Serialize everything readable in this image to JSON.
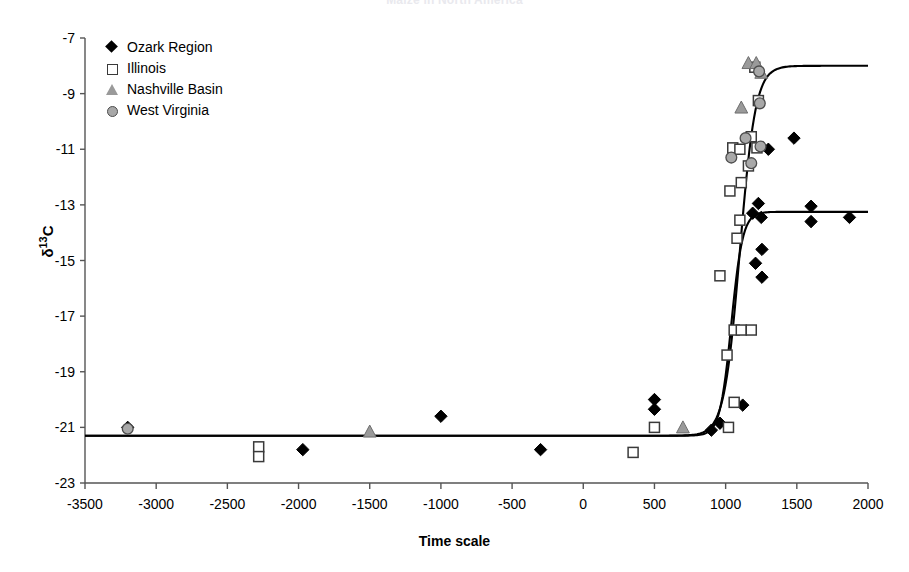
{
  "chart_data": {
    "type": "scatter",
    "title": "Maize in North America",
    "xlabel": "Time scale",
    "ylabel": "δ 13C",
    "xlim": [
      -3500,
      2000
    ],
    "ylim": [
      -23,
      -7
    ],
    "xticks": [
      -3500,
      -3000,
      -2500,
      -2000,
      -1500,
      -1000,
      -500,
      0,
      500,
      1000,
      1500,
      2000
    ],
    "yticks": [
      -23,
      -21,
      -19,
      -17,
      -15,
      -13,
      -11,
      -9,
      -7
    ],
    "xtick_labels": [
      "-3500",
      "-3000",
      "-2500",
      "-2000",
      "-1500",
      "-1000",
      "-500",
      "0",
      "500",
      "1000",
      "1500",
      "2000"
    ],
    "ytick_labels": [
      "-23",
      "-21",
      "-19",
      "-17",
      "-15",
      "-13",
      "-11",
      "-9",
      "-7"
    ],
    "grid": false,
    "legend_position": "top-left",
    "series": [
      {
        "name": "Ozark Region",
        "marker": "diamond",
        "color": "#000000",
        "fill": "#000000",
        "points": [
          [
            -3200,
            -21.0
          ],
          [
            -1970,
            -21.8
          ],
          [
            -1000,
            -20.6
          ],
          [
            -300,
            -21.8
          ],
          [
            500,
            -20.0
          ],
          [
            500,
            -20.35
          ],
          [
            900,
            -21.1
          ],
          [
            960,
            -20.85
          ],
          [
            1120,
            -20.2
          ],
          [
            1190,
            -13.3
          ],
          [
            1230,
            -12.95
          ],
          [
            1250,
            -13.45
          ],
          [
            1255,
            -14.6
          ],
          [
            1210,
            -15.1
          ],
          [
            1255,
            -15.6
          ],
          [
            1300,
            -11.0
          ],
          [
            1480,
            -10.6
          ],
          [
            1600,
            -13.05
          ],
          [
            1600,
            -13.6
          ],
          [
            1870,
            -13.45
          ]
        ]
      },
      {
        "name": "Illinois",
        "marker": "square",
        "color": "#3a3a3a",
        "fill": "#ffffff",
        "points": [
          [
            -2280,
            -21.7
          ],
          [
            -2280,
            -22.05
          ],
          [
            350,
            -21.9
          ],
          [
            500,
            -21.0
          ],
          [
            1020,
            -21.0
          ],
          [
            1060,
            -20.1
          ],
          [
            1010,
            -18.4
          ],
          [
            1060,
            -17.5
          ],
          [
            1110,
            -17.5
          ],
          [
            1180,
            -17.5
          ],
          [
            960,
            -15.55
          ],
          [
            1080,
            -14.2
          ],
          [
            1100,
            -13.55
          ],
          [
            1030,
            -12.5
          ],
          [
            1110,
            -12.2
          ],
          [
            1160,
            -11.6
          ],
          [
            1050,
            -10.95
          ],
          [
            1100,
            -11.0
          ],
          [
            1180,
            -10.55
          ],
          [
            1220,
            -10.95
          ],
          [
            1230,
            -9.25
          ],
          [
            1205,
            -8.05
          ]
        ]
      },
      {
        "name": "Nashville Basin",
        "marker": "triangle",
        "color": "#9a9a9a",
        "fill": "#9a9a9a",
        "points": [
          [
            -1500,
            -21.15
          ],
          [
            700,
            -21.0
          ],
          [
            1110,
            -9.5
          ],
          [
            1160,
            -7.9
          ],
          [
            1215,
            -7.9
          ],
          [
            1250,
            -8.25
          ]
        ]
      },
      {
        "name": "West Virginia",
        "marker": "circle",
        "color": "#4d4d4d",
        "fill": "#a8a8a8",
        "points": [
          [
            -3200,
            -21.05
          ],
          [
            1040,
            -11.3
          ],
          [
            1140,
            -10.6
          ],
          [
            1180,
            -11.5
          ],
          [
            1245,
            -10.9
          ],
          [
            1240,
            -9.35
          ],
          [
            1235,
            -8.2
          ]
        ]
      }
    ],
    "fit_curves": [
      {
        "name": "upper-sigmoid",
        "description": "sigmoid rising from -21.3 to -8.0 centered near AD 1100",
        "y_low": -21.3,
        "y_high": -8.0,
        "center": 1100,
        "width": 55
      },
      {
        "name": "lower-sigmoid",
        "description": "sigmoid rising from -21.3 to -13.25 centered near AD 1040",
        "y_low": -21.3,
        "y_high": -13.25,
        "center": 1040,
        "width": 40
      }
    ]
  },
  "legend": {
    "items": [
      {
        "label": "Ozark Region",
        "marker": "diamond"
      },
      {
        "label": "Illinois",
        "marker": "square"
      },
      {
        "label": "Nashville Basin",
        "marker": "triangle"
      },
      {
        "label": "West Virginia",
        "marker": "circle"
      }
    ]
  },
  "axis": {
    "y_title_main": "δ",
    "y_title_sup": "13",
    "y_title_tail": "C",
    "x_title": "Time scale"
  }
}
